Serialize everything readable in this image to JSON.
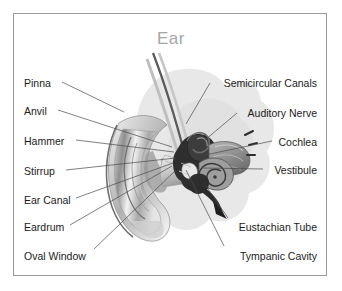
{
  "figure": {
    "title": "Ear",
    "frame_color": "#9a9a9a",
    "background_color": "#ffffff",
    "title_color": "#a6a6a6",
    "label_color": "#1b1b1b",
    "leader_line_color": "#4a4a4a"
  },
  "labels_left": [
    {
      "text": "Pinna",
      "x": 24,
      "y": 78,
      "line": [
        62,
        82,
        124,
        112
      ]
    },
    {
      "text": "Anvil",
      "x": 24,
      "y": 106,
      "line": [
        58,
        110,
        172,
        147
      ]
    },
    {
      "text": "Hammer",
      "x": 24,
      "y": 136,
      "line": [
        76,
        140,
        174,
        152
      ]
    },
    {
      "text": "Stirrup",
      "x": 24,
      "y": 166,
      "line": [
        66,
        170,
        176,
        158
      ]
    },
    {
      "text": "Ear Canal",
      "x": 24,
      "y": 195,
      "line": [
        76,
        198,
        173,
        163
      ]
    },
    {
      "text": "Eardrum",
      "x": 24,
      "y": 222,
      "line": [
        70,
        225,
        172,
        166
      ]
    },
    {
      "text": "Oval Window",
      "x": 24,
      "y": 251,
      "line": [
        94,
        249,
        176,
        170
      ]
    }
  ],
  "labels_right": [
    {
      "text": "Semicircular Canals",
      "x": 317,
      "y": 78,
      "line": [
        210,
        83,
        186,
        124
      ]
    },
    {
      "text": "Auditory Nerve",
      "x": 317,
      "y": 108,
      "line": [
        237,
        113,
        205,
        140
      ]
    },
    {
      "text": "Cochlea",
      "x": 317,
      "y": 137,
      "line": [
        272,
        141,
        205,
        155
      ]
    },
    {
      "text": "Vestibule",
      "x": 317,
      "y": 165,
      "line": [
        263,
        169,
        202,
        168
      ]
    },
    {
      "text": "Eustachian Tube",
      "x": 317,
      "y": 222,
      "line": [
        228,
        218,
        206,
        186
      ]
    },
    {
      "text": "Tympanic Cavity",
      "x": 317,
      "y": 251,
      "line": [
        224,
        246,
        186,
        170
      ]
    }
  ]
}
